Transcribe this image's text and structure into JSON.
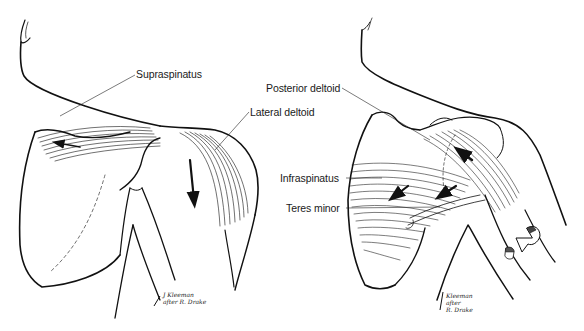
{
  "figure": {
    "colors": {
      "background": "#ffffff",
      "ink": "#111111",
      "label_text": "#1a1a1a"
    }
  },
  "left_view": {
    "labels": [
      {
        "id": "supraspinatus",
        "text": "Supraspinatus"
      },
      {
        "id": "lateral-deltoid",
        "text": "Lateral deltoid"
      }
    ],
    "signature": {
      "line1": "J Kleeman",
      "line2": "after R. Drake"
    }
  },
  "right_view": {
    "labels": [
      {
        "id": "posterior-deltoid",
        "text": "Posterior deltoid"
      },
      {
        "id": "infraspinatus",
        "text": "Infraspinatus"
      },
      {
        "id": "teres-minor",
        "text": "Teres minor"
      }
    ],
    "signature": {
      "line1": "Kleeman",
      "line2": "after",
      "line3": "R. Drake"
    }
  }
}
